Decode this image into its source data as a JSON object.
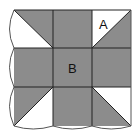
{
  "diagram": {
    "labels": {
      "a": "A",
      "b": "B"
    },
    "colors": {
      "fill": "#8c8c8c",
      "background": "#ffffff",
      "line": "#222222",
      "edge": "#555555"
    },
    "grid": {
      "rows": 3,
      "cols": 3
    }
  }
}
